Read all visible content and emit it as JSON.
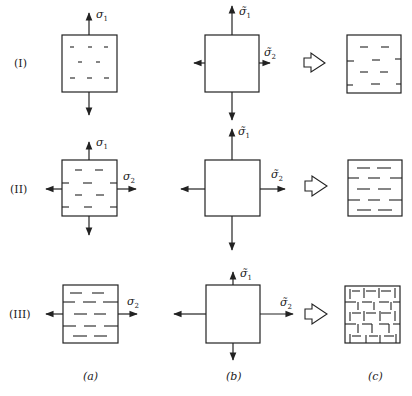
{
  "figure": {
    "rows": [
      {
        "label": "(I)",
        "a_labels": [
          "σ",
          "1"
        ],
        "b_labels": {
          "s1": [
            "σ̃",
            "1"
          ],
          "s2": [
            "σ̃",
            "2"
          ]
        }
      },
      {
        "label": "(II)",
        "a_labels": {
          "s1": [
            "σ",
            "1"
          ],
          "s2": [
            "σ",
            "2"
          ]
        },
        "b_labels": {
          "s1": [
            "σ̃",
            "1"
          ],
          "s2": [
            "σ̃",
            "2"
          ]
        }
      },
      {
        "label": "(III)",
        "a_labels": {
          "s2": [
            "σ",
            "2"
          ]
        },
        "b_labels": {
          "s1": [
            "σ̃",
            "1"
          ],
          "s2": [
            "σ̃",
            "2"
          ]
        }
      }
    ],
    "columns": [
      {
        "caption": "(a)"
      },
      {
        "caption": "(b)"
      },
      {
        "caption": "(c)"
      }
    ],
    "colors": {
      "ink": "#222222",
      "background": "#ffffff"
    }
  }
}
